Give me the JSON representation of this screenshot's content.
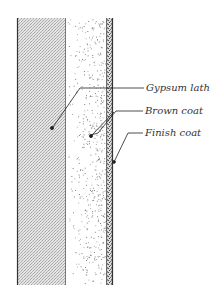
{
  "diagram": {
    "type": "wall-section",
    "layers": [
      {
        "id": "gypsum-lath",
        "name": "Gypsum lath",
        "pattern": "crosshatch",
        "color": "#c8c8c8"
      },
      {
        "id": "brown-coat",
        "name": "Brown coat",
        "pattern": "sparse-stipple",
        "color": "#ffffff"
      },
      {
        "id": "finish-coat",
        "name": "Finish coat",
        "pattern": "dense-stipple",
        "color": "#9a9a9a"
      }
    ],
    "labels": {
      "gypsum_lath": "Gypsum lath",
      "brown_coat": "Brown coat",
      "finish_coat": "Finish coat"
    },
    "colors": {
      "line": "#333333",
      "lath_fill": "#d0d0d0",
      "stipple": "#555555"
    }
  }
}
